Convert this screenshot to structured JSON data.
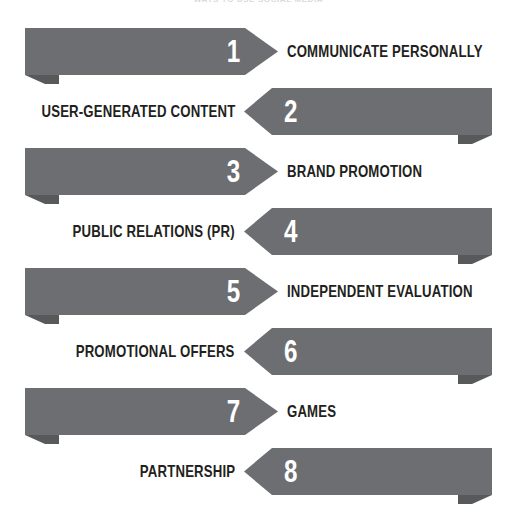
{
  "header": {
    "watermark_text": "WAYS TO USE SOCIAL MEDIA"
  },
  "diagram": {
    "colors": {
      "arrow_fill": "#6d6e71",
      "arrow_shadow": "#58595b",
      "number_text": "#ffffff",
      "label_text": "#231f20",
      "background": "#ffffff"
    },
    "rows": [
      {
        "number": "1",
        "label": "COMMUNICATE PERSONALLY",
        "direction": "right"
      },
      {
        "number": "2",
        "label": "USER-GENERATED CONTENT",
        "direction": "left"
      },
      {
        "number": "3",
        "label": "BRAND PROMOTION",
        "direction": "right"
      },
      {
        "number": "4",
        "label": "PUBLIC RELATIONS (PR)",
        "direction": "left"
      },
      {
        "number": "5",
        "label": "INDEPENDENT EVALUATION",
        "direction": "right"
      },
      {
        "number": "6",
        "label": "PROMOTIONAL OFFERS",
        "direction": "left"
      },
      {
        "number": "7",
        "label": "GAMES",
        "direction": "right"
      },
      {
        "number": "8",
        "label": "PARTNERSHIP",
        "direction": "left"
      }
    ]
  }
}
